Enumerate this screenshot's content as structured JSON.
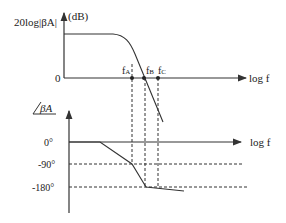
{
  "magnitude_plot": {
    "y_label": "20log|βA|",
    "y_unit": "(dB)",
    "origin_label": "0",
    "x_label": "log f",
    "markers": [
      {
        "name": "fA",
        "main": "f",
        "sub": "A"
      },
      {
        "name": "fB",
        "main": "f",
        "sub": "B"
      },
      {
        "name": "fC",
        "main": "f",
        "sub": "C"
      }
    ]
  },
  "phase_plot": {
    "y_label": "βA",
    "x_label": "log f",
    "ticks": [
      "0°",
      "-90°",
      "-180°"
    ]
  },
  "colors": {
    "line": "#333333",
    "background": "#ffffff"
  }
}
